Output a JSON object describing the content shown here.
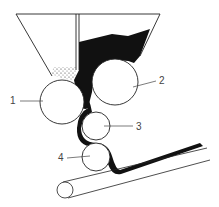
{
  "diagram": {
    "type": "technical-illustration",
    "colors": {
      "background": "#ffffff",
      "line": "#222222",
      "fill_material": "#111111",
      "label": "#444444"
    },
    "labels": [
      {
        "id": "1",
        "text": "1",
        "target": "left roller"
      },
      {
        "id": "2",
        "text": "2",
        "target": "right roller"
      },
      {
        "id": "3",
        "text": "3",
        "target": "middle small roller"
      },
      {
        "id": "4",
        "text": "4",
        "target": "lower small roller"
      }
    ]
  }
}
